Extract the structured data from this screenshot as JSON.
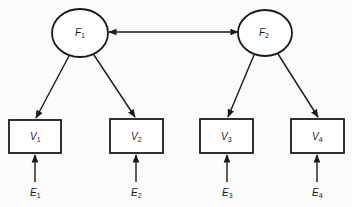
{
  "diagram": {
    "type": "structural-equation-model",
    "colors": {
      "line": "#1a1a1a",
      "background": "#fbfbfb",
      "node_fill": "#ffffff"
    },
    "latent_factors": [
      {
        "id": "F1",
        "letter": "F",
        "sub": "1",
        "cx": 80,
        "cy": 33,
        "rx": 28,
        "ry": 24
      },
      {
        "id": "F2",
        "letter": "F",
        "sub": "2",
        "cx": 265,
        "cy": 33,
        "rx": 27,
        "ry": 23
      }
    ],
    "observed_variables": [
      {
        "id": "V1",
        "letter": "V",
        "sub": "1",
        "x": 9,
        "y": 120,
        "w": 52,
        "h": 33
      },
      {
        "id": "V2",
        "letter": "V",
        "sub": "2",
        "x": 110,
        "y": 119,
        "w": 53,
        "h": 34
      },
      {
        "id": "V3",
        "letter": "V",
        "sub": "3",
        "x": 200,
        "y": 119,
        "w": 53,
        "h": 34
      },
      {
        "id": "V4",
        "letter": "V",
        "sub": "4",
        "x": 291,
        "y": 119,
        "w": 53,
        "h": 34
      }
    ],
    "error_terms": [
      {
        "id": "E1",
        "letter": "E",
        "sub": "1",
        "target": "V1"
      },
      {
        "id": "E2",
        "letter": "E",
        "sub": "2",
        "target": "V2"
      },
      {
        "id": "E3",
        "letter": "E",
        "sub": "3",
        "target": "V3"
      },
      {
        "id": "E4",
        "letter": "E",
        "sub": "4",
        "target": "V4"
      }
    ],
    "edges": [
      {
        "from": "F1",
        "to": "F2",
        "kind": "covariance-double-headed"
      },
      {
        "from": "F1",
        "to": "V1",
        "kind": "loading"
      },
      {
        "from": "F1",
        "to": "V2",
        "kind": "loading"
      },
      {
        "from": "F2",
        "to": "V3",
        "kind": "loading"
      },
      {
        "from": "F2",
        "to": "V4",
        "kind": "loading"
      },
      {
        "from": "E1",
        "to": "V1",
        "kind": "error"
      },
      {
        "from": "E2",
        "to": "V2",
        "kind": "error"
      },
      {
        "from": "E3",
        "to": "V3",
        "kind": "error"
      },
      {
        "from": "E4",
        "to": "V4",
        "kind": "error"
      }
    ]
  },
  "labels": {
    "F1": {
      "letter": "F",
      "sub": "1"
    },
    "F2": {
      "letter": "F",
      "sub": "2"
    },
    "V1": {
      "letter": "V",
      "sub": "1"
    },
    "V2": {
      "letter": "V",
      "sub": "2"
    },
    "V3": {
      "letter": "V",
      "sub": "3"
    },
    "V4": {
      "letter": "V",
      "sub": "4"
    },
    "E1": {
      "letter": "E",
      "sub": "1"
    },
    "E2": {
      "letter": "E",
      "sub": "2"
    },
    "E3": {
      "letter": "E",
      "sub": "3"
    },
    "E4": {
      "letter": "E",
      "sub": "4"
    }
  }
}
